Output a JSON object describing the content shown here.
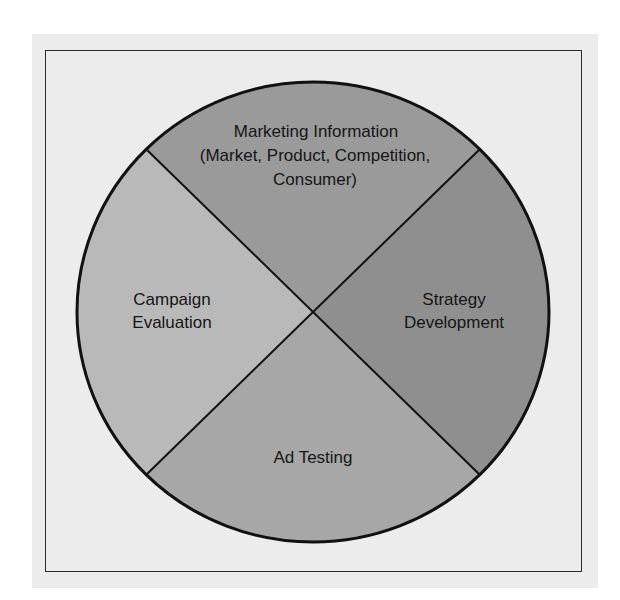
{
  "diagram": {
    "type": "circular-cycle",
    "colors": {
      "page_background": "#ffffff",
      "panel_background": "#ececec",
      "outline": "#111111",
      "top_segment": "#9a9a9a",
      "right_segment": "#8f8f8f",
      "bottom_segment": "#a7a7a7",
      "left_segment": "#b9b9b9"
    },
    "segments": [
      {
        "position": "top",
        "lines": [
          "Marketing Information",
          "(Market, Product, Competition,",
          "Consumer)"
        ]
      },
      {
        "position": "right",
        "lines": [
          "Strategy",
          "Development"
        ]
      },
      {
        "position": "bottom",
        "lines": [
          "Ad Testing"
        ]
      },
      {
        "position": "left",
        "lines": [
          "Campaign",
          "Evaluation"
        ]
      }
    ]
  }
}
